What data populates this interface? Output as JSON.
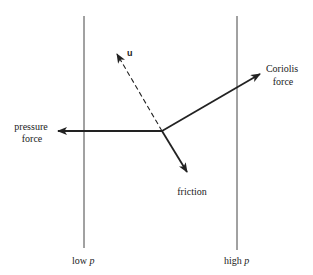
{
  "diagram": {
    "isobars": [
      {
        "label_text": "low ",
        "label_var": "p"
      },
      {
        "label_text": "high ",
        "label_var": "p"
      }
    ],
    "vectors": {
      "u": {
        "label": "u",
        "style": "dashed"
      },
      "coriolis": {
        "label_line1": "Coriolis",
        "label_line2": "force"
      },
      "pressure": {
        "label_line1": "pressure",
        "label_line2": "force"
      },
      "friction": {
        "label": "friction"
      }
    },
    "colors": {
      "line": "#222222",
      "background": "#ffffff"
    }
  }
}
